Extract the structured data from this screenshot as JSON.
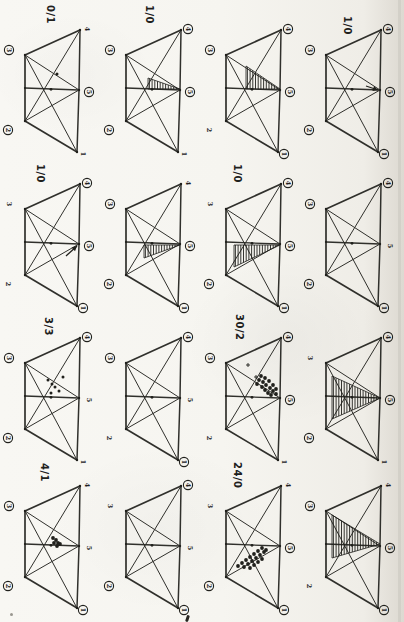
{
  "page": {
    "background": "#f6f5f0",
    "ink": "#20201c",
    "crease_color": "#cfccc4",
    "description_marks": {
      "hatch_region": "vertical-hatched triangle region pointing at node 5",
      "dot_cluster": "cluster of hand-drawn data dots",
      "arrow": "small hand-drawn arrow pointing at node 5"
    }
  },
  "figure": {
    "rows": 4,
    "cols": 4,
    "col_x": [
      3,
      104,
      204,
      304
    ],
    "row_y": [
      2,
      156,
      310,
      458
    ],
    "cells": [
      {
        "id": "r1c1",
        "label": "0/1",
        "label_pos": [
          44,
          3
        ],
        "nodes": [
          {
            "n": "1",
            "circled": false
          },
          {
            "n": "2",
            "circled": true
          },
          {
            "n": "3",
            "circled": true
          },
          {
            "n": "4",
            "circled": false
          },
          {
            "n": "5",
            "circled": true
          }
        ],
        "marks": [
          {
            "type": "dots",
            "heavy": false,
            "points": [
              [
                54,
                72
              ]
            ]
          }
        ]
      },
      {
        "id": "r1c2",
        "label": "1/0",
        "label_pos": [
          42,
          3
        ],
        "nodes": [
          {
            "n": "1",
            "circled": false
          },
          {
            "n": "2",
            "circled": true
          },
          {
            "n": "3",
            "circled": true
          },
          {
            "n": "4",
            "circled": true
          },
          {
            "n": "5",
            "circled": true
          }
        ],
        "marks": [
          {
            "type": "hatch",
            "points": [
              [
                76,
                87
              ],
              [
                44,
                76
              ],
              [
                44,
                87
              ]
            ]
          }
        ]
      },
      {
        "id": "r1c3",
        "label": "",
        "label_pos": [
          40,
          3
        ],
        "nodes": [
          {
            "n": "1",
            "circled": true
          },
          {
            "n": "2",
            "circled": false
          },
          {
            "n": "3",
            "circled": true
          },
          {
            "n": "4",
            "circled": true
          },
          {
            "n": "5",
            "circled": true
          }
        ],
        "marks": [
          {
            "type": "hatch",
            "points": [
              [
                76,
                87
              ],
              [
                42,
                64
              ],
              [
                42,
                87
              ]
            ]
          }
        ]
      },
      {
        "id": "r1c4",
        "label": "1/0",
        "label_pos": [
          40,
          14
        ],
        "nodes": [
          {
            "n": "1",
            "circled": true
          },
          {
            "n": "2",
            "circled": true
          },
          {
            "n": "3",
            "circled": true
          },
          {
            "n": "4",
            "circled": true
          },
          {
            "n": "5",
            "circled": true
          }
        ],
        "marks": [
          {
            "type": "arrow",
            "points": [
              [
                62,
                84
              ],
              [
                74,
                88
              ]
            ]
          }
        ]
      },
      {
        "id": "r2c1",
        "label": "1/0",
        "label_pos": [
          34,
          8
        ],
        "nodes": [
          {
            "n": "1",
            "circled": true
          },
          {
            "n": "2",
            "circled": false
          },
          {
            "n": "3",
            "circled": false
          },
          {
            "n": "4",
            "circled": true
          },
          {
            "n": "5",
            "circled": true
          }
        ],
        "marks": [
          {
            "type": "arrow",
            "points": [
              [
                63,
                100
              ],
              [
                74,
                90
              ]
            ]
          }
        ]
      },
      {
        "id": "r2c2",
        "label": "",
        "label_pos": [
          40,
          4
        ],
        "nodes": [
          {
            "n": "1",
            "circled": true
          },
          {
            "n": "2",
            "circled": true
          },
          {
            "n": "3",
            "circled": true
          },
          {
            "n": "4",
            "circled": false
          },
          {
            "n": "5",
            "circled": true
          }
        ],
        "marks": [
          {
            "type": "hatch",
            "points": [
              [
                76,
                89
              ],
              [
                40,
                89
              ],
              [
                40,
                102
              ]
            ]
          }
        ]
      },
      {
        "id": "r2c3",
        "label": "1/0",
        "label_pos": [
          30,
          8
        ],
        "nodes": [
          {
            "n": "1",
            "circled": true
          },
          {
            "n": "2",
            "circled": true
          },
          {
            "n": "3",
            "circled": false
          },
          {
            "n": "4",
            "circled": true
          },
          {
            "n": "5",
            "circled": true
          }
        ],
        "marks": [
          {
            "type": "hatch",
            "points": [
              [
                76,
                89
              ],
              [
                30,
                89
              ],
              [
                30,
                111
              ]
            ]
          }
        ]
      },
      {
        "id": "r2c4",
        "label": "",
        "label_pos": [
          40,
          4
        ],
        "nodes": [
          {
            "n": "1",
            "circled": true
          },
          {
            "n": "2",
            "circled": true
          },
          {
            "n": "3",
            "circled": true
          },
          {
            "n": "4",
            "circled": true
          },
          {
            "n": "5",
            "circled": false
          }
        ],
        "marks": []
      },
      {
        "id": "r3c1",
        "label": "3/3",
        "label_pos": [
          42,
          7
        ],
        "nodes": [
          {
            "n": "1",
            "circled": false
          },
          {
            "n": "2",
            "circled": true
          },
          {
            "n": "3",
            "circled": true
          },
          {
            "n": "4",
            "circled": true
          },
          {
            "n": "5",
            "circled": false
          }
        ],
        "marks": [
          {
            "type": "dots",
            "heavy": false,
            "points": [
              [
                45,
                70
              ],
              [
                49,
                74
              ],
              [
                52,
                77
              ],
              [
                56,
                81
              ],
              [
                48,
                83
              ],
              [
                60,
                67
              ]
            ]
          }
        ]
      },
      {
        "id": "r3c2",
        "label": "",
        "label_pos": [
          40,
          4
        ],
        "nodes": [
          {
            "n": "1",
            "circled": true
          },
          {
            "n": "2",
            "circled": false
          },
          {
            "n": "3",
            "circled": true
          },
          {
            "n": "4",
            "circled": true
          },
          {
            "n": "5",
            "circled": false
          }
        ],
        "marks": []
      },
      {
        "id": "r3c3",
        "label": "30/2",
        "label_pos": [
          32,
          4
        ],
        "nodes": [
          {
            "n": "1",
            "circled": false
          },
          {
            "n": "2",
            "circled": false
          },
          {
            "n": "3",
            "circled": true
          },
          {
            "n": "4",
            "circled": true
          },
          {
            "n": "5",
            "circled": true
          }
        ],
        "marks": [
          {
            "type": "dots",
            "heavy": true,
            "points": [
              [
                55,
                70
              ],
              [
                59,
                72
              ],
              [
                62,
                75
              ],
              [
                66,
                78
              ],
              [
                69,
                81
              ],
              [
                72,
                84
              ],
              [
                58,
                77
              ],
              [
                61,
                80
              ],
              [
                64,
                83
              ],
              [
                67,
                85
              ],
              [
                57,
                66
              ],
              [
                61,
                68
              ],
              [
                65,
                71
              ],
              [
                69,
                75
              ],
              [
                72,
                79
              ],
              [
                53,
                74
              ]
            ]
          },
          {
            "type": "plus",
            "points": [
              [
                44,
                55
              ],
              [
                52,
                67
              ]
            ]
          }
        ]
      },
      {
        "id": "r3c4",
        "label": "",
        "label_pos": [
          40,
          4
        ],
        "nodes": [
          {
            "n": "1",
            "circled": false
          },
          {
            "n": "2",
            "circled": true
          },
          {
            "n": "3",
            "circled": false
          },
          {
            "n": "4",
            "circled": true
          },
          {
            "n": "5",
            "circled": true
          }
        ],
        "marks": [
          {
            "type": "hatch",
            "points": [
              [
                76,
                88
              ],
              [
                28,
                66
              ],
              [
                28,
                109
              ]
            ]
          }
        ]
      },
      {
        "id": "r4c1",
        "label": "4/1",
        "label_pos": [
          38,
          5
        ],
        "nodes": [
          {
            "n": "1",
            "circled": true
          },
          {
            "n": "2",
            "circled": true
          },
          {
            "n": "3",
            "circled": true
          },
          {
            "n": "4",
            "circled": false
          },
          {
            "n": "5",
            "circled": false
          }
        ],
        "marks": [
          {
            "type": "dots",
            "heavy": true,
            "points": [
              [
                50,
                80
              ],
              [
                53,
                82
              ],
              [
                55,
                85
              ],
              [
                51,
                85
              ],
              [
                54,
                88
              ],
              [
                57,
                86
              ]
            ]
          }
        ]
      },
      {
        "id": "r4c2",
        "label": "",
        "label_pos": [
          40,
          4
        ],
        "nodes": [
          {
            "n": "1",
            "circled": true
          },
          {
            "n": "2",
            "circled": true
          },
          {
            "n": "3",
            "circled": false
          },
          {
            "n": "4",
            "circled": true
          },
          {
            "n": "5",
            "circled": false
          }
        ],
        "marks": []
      },
      {
        "id": "r4c3",
        "label": "24/0",
        "label_pos": [
          30,
          4
        ],
        "nodes": [
          {
            "n": "1",
            "circled": true
          },
          {
            "n": "2",
            "circled": true
          },
          {
            "n": "3",
            "circled": false
          },
          {
            "n": "4",
            "circled": false
          },
          {
            "n": "5",
            "circled": true
          }
        ],
        "marks": [
          {
            "type": "dots",
            "heavy": true,
            "points": [
              [
                34,
                108
              ],
              [
                38,
                105
              ],
              [
                42,
                102
              ],
              [
                46,
                99
              ],
              [
                50,
                96
              ],
              [
                54,
                93
              ],
              [
                58,
                90
              ],
              [
                40,
                109
              ],
              [
                44,
                106
              ],
              [
                48,
                103
              ],
              [
                52,
                100
              ],
              [
                56,
                97
              ],
              [
                60,
                94
              ],
              [
                46,
                110
              ],
              [
                50,
                107
              ],
              [
                54,
                104
              ],
              [
                58,
                101
              ],
              [
                62,
                92
              ]
            ]
          }
        ]
      },
      {
        "id": "r4c4",
        "label": "",
        "label_pos": [
          40,
          4
        ],
        "nodes": [
          {
            "n": "1",
            "circled": true
          },
          {
            "n": "2",
            "circled": false
          },
          {
            "n": "3",
            "circled": true
          },
          {
            "n": "4",
            "circled": false
          },
          {
            "n": "5",
            "circled": true
          }
        ],
        "marks": [
          {
            "type": "hatch",
            "points": [
              [
                76,
                86
              ],
              [
                28,
                57
              ],
              [
                28,
                100
              ]
            ]
          }
        ]
      }
    ]
  },
  "strays": {
    "dot": [
      10,
      613
    ],
    "tick": [
      186,
      615
    ]
  }
}
